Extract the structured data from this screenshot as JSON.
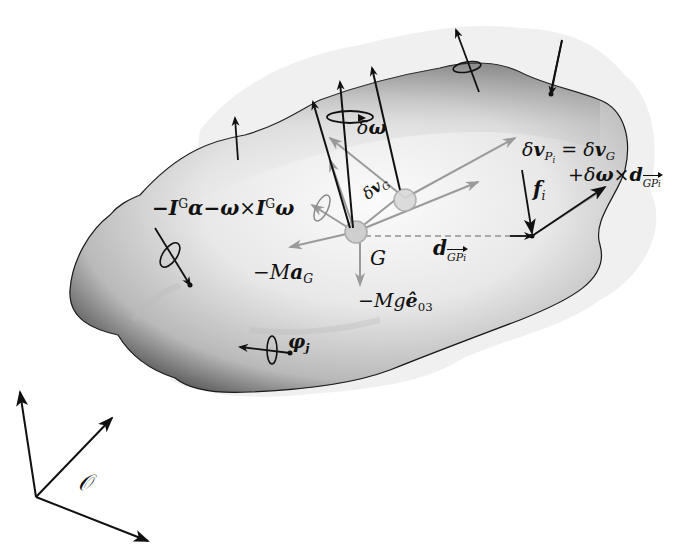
{
  "figure": {
    "type": "rigid-body free-body diagram",
    "colors": {
      "background": "#ffffff",
      "body_light": "#f2f2f2",
      "body_dark": "#1a1a1a",
      "halo": "#ececec",
      "arrow_dark": "#111111",
      "arrow_grey": "#9a9a9a"
    }
  },
  "labels": {
    "inertial_torque": {
      "minus": "−",
      "I1": "I",
      "G1": "G",
      "alpha": "α",
      "minus2": "−",
      "omega1": "ω",
      "times": "×",
      "I2": "I",
      "G2": "G",
      "omega2": "ω"
    },
    "delta_omega": {
      "delta": "δ",
      "omega": "ω"
    },
    "delta_vG": {
      "delta": "δ",
      "v": "v",
      "sub": "G"
    },
    "delta_vPi": {
      "delta": "δ",
      "v": "v",
      "sub": "P",
      "subsub": "i",
      "eq": "=",
      "delta2": "δ",
      "v2": "v",
      "sub2": "G"
    },
    "plus_term": {
      "plus": "+",
      "delta": "δ",
      "omega": "ω",
      "times": "×",
      "d": "d",
      "sub": "GP",
      "subsub": "i"
    },
    "force_i": {
      "f": "f",
      "sub": "i"
    },
    "distance": {
      "d": "d",
      "sub": "GP",
      "subsub": "i"
    },
    "G_point": "G",
    "inertial_force": {
      "minus": "−",
      "M": "M",
      "a": "a",
      "sub": "G"
    },
    "gravity": {
      "minus": "−",
      "M": "M",
      "g": "g",
      "e": "ê",
      "sub": "03"
    },
    "moment_j": {
      "phi": "φ",
      "sub": "j"
    },
    "frame_origin": "𝒪"
  }
}
